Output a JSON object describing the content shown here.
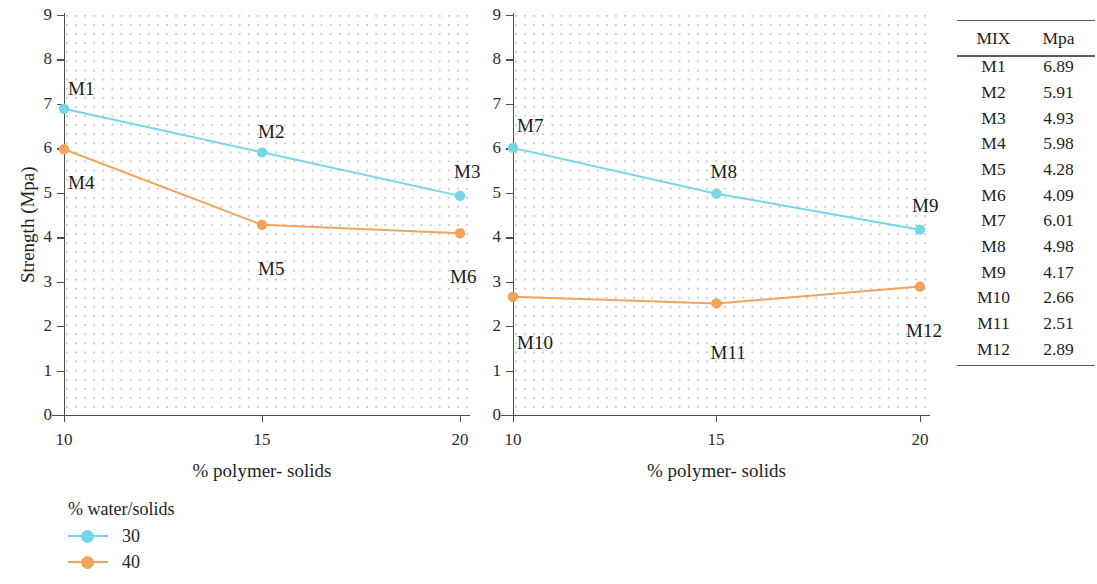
{
  "chart_data": [
    {
      "type": "line",
      "id": "chart-left",
      "title": "",
      "xlabel": "% polymer- solids",
      "ylabel": "Strength (Mpa)",
      "x": [
        10,
        15,
        20
      ],
      "xticks": [
        "10",
        "15",
        "20"
      ],
      "yticks": [
        "0",
        "1",
        "2",
        "3",
        "4",
        "5",
        "6",
        "7",
        "8",
        "9"
      ],
      "xlim": [
        10,
        20
      ],
      "ylim": [
        0,
        9
      ],
      "grid": "dotted",
      "series": [
        {
          "name": "30",
          "color": "#76D6E8",
          "values": [
            6.89,
            5.91,
            4.93
          ],
          "point_labels": [
            "M1",
            "M2",
            "M3"
          ]
        },
        {
          "name": "40",
          "color": "#F2A35C",
          "values": [
            5.98,
            4.28,
            4.09
          ],
          "point_labels": [
            "M4",
            "M5",
            "M6"
          ]
        }
      ]
    },
    {
      "type": "line",
      "id": "chart-right",
      "title": "",
      "xlabel": "% polymer- solids",
      "ylabel": "",
      "x": [
        10,
        15,
        20
      ],
      "xticks": [
        "10",
        "15",
        "20"
      ],
      "yticks": [
        "0",
        "1",
        "2",
        "3",
        "4",
        "5",
        "6",
        "7",
        "8",
        "9"
      ],
      "xlim": [
        10,
        20
      ],
      "ylim": [
        0,
        9
      ],
      "grid": "dotted",
      "series": [
        {
          "name": "30",
          "color": "#76D6E8",
          "values": [
            6.01,
            4.98,
            4.17
          ],
          "point_labels": [
            "M7",
            "M8",
            "M9"
          ]
        },
        {
          "name": "40",
          "color": "#F2A35C",
          "values": [
            2.66,
            2.51,
            2.89
          ],
          "point_labels": [
            "M10",
            "M11",
            "M12"
          ]
        }
      ]
    }
  ],
  "legend": {
    "title": "% water/solids",
    "position": "bottom-left",
    "entries": [
      {
        "label": "30",
        "color": "#76D6E8"
      },
      {
        "label": "40",
        "color": "#F2A35C"
      }
    ]
  },
  "table": {
    "columns": [
      "MIX",
      "Mpa"
    ],
    "rows": [
      [
        "M1",
        "6.89"
      ],
      [
        "M2",
        "5.91"
      ],
      [
        "M3",
        "4.93"
      ],
      [
        "M4",
        "5.98"
      ],
      [
        "M5",
        "4.28"
      ],
      [
        "M6",
        "4.09"
      ],
      [
        "M7",
        "6.01"
      ],
      [
        "M8",
        "4.98"
      ],
      [
        "M9",
        "4.17"
      ],
      [
        "M10",
        "2.66"
      ],
      [
        "M11",
        "2.51"
      ],
      [
        "M12",
        "2.89"
      ]
    ]
  },
  "colors": {
    "series_30": "#76D6E8",
    "series_40": "#F2A35C",
    "axis": "#4d4d4d",
    "grid_dot": "#c9c9c9",
    "text": "#1f1f1f"
  }
}
